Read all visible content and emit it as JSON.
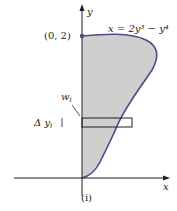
{
  "figure": {
    "caption": "(i)",
    "equation": "x = 2y³ − y⁴",
    "axes": {
      "x_label": "x",
      "y_label": "y"
    },
    "point": {
      "label": "(0, 2)"
    },
    "strip": {
      "width_label_main": "w",
      "width_label_sub": "i",
      "height_label_delta": "Δ y",
      "height_label_sub": "i"
    },
    "colors": {
      "shaded_region": "#cfcfcf",
      "curve": "#4a4a8c",
      "axes": "#231f20",
      "strip": "#231f20",
      "point": "#4a4a8c"
    }
  }
}
